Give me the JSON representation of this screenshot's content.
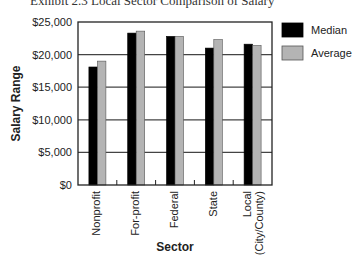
{
  "chart_data": {
    "type": "bar",
    "title": "Exhibit 2.3   Local Sector Comparison of Salary",
    "xlabel": "Sector",
    "ylabel": "Salary Range",
    "ylim": [
      0,
      25000
    ],
    "yticks": [
      0,
      5000,
      10000,
      15000,
      20000,
      25000
    ],
    "ytick_labels": [
      "$0",
      "$5,000",
      "$10,000",
      "$15,000",
      "$20,000",
      "$25,000"
    ],
    "grid": "horizontal",
    "legend_position": "top-right-outside",
    "categories": [
      "Nonprofit",
      "For-profit",
      "Federal",
      "State",
      "Local\n(City/County)"
    ],
    "series": [
      {
        "name": "Median",
        "color": "#000000",
        "values": [
          18100,
          23300,
          22800,
          21000,
          21600
        ]
      },
      {
        "name": "Average",
        "color": "#b4b4b4",
        "values": [
          19000,
          23600,
          22800,
          22300,
          21400
        ]
      }
    ]
  }
}
